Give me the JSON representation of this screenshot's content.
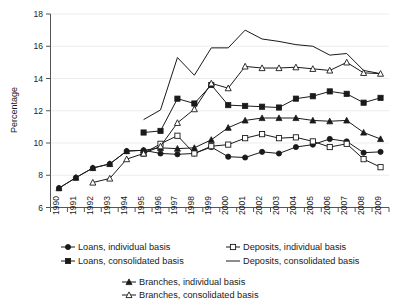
{
  "chart_data": {
    "type": "line",
    "title": "",
    "xlabel": "",
    "ylabel": "Percentage",
    "ylim": [
      6,
      18
    ],
    "yticks": [
      6,
      8,
      10,
      12,
      14,
      16,
      18
    ],
    "grid": true,
    "legend_position": "bottom",
    "categories": [
      "1990",
      "1991",
      "1992",
      "1993",
      "1994",
      "1995",
      "1996",
      "1997",
      "1998",
      "1999",
      "2000",
      "2001",
      "2002",
      "2003",
      "2004",
      "2005",
      "2006",
      "2007",
      "2008",
      "2009"
    ],
    "series": [
      {
        "name": "Loans, individual basis",
        "marker": "filled-circle",
        "values": [
          7.2,
          7.85,
          8.45,
          8.7,
          9.5,
          9.55,
          9.35,
          9.3,
          9.35,
          9.75,
          9.15,
          9.1,
          9.45,
          9.35,
          9.75,
          9.9,
          10.25,
          10.1,
          9.4,
          9.45
        ]
      },
      {
        "name": "Loans, consolidated basis",
        "marker": "filled-square",
        "values": [
          null,
          null,
          null,
          null,
          null,
          10.65,
          10.75,
          12.75,
          12.45,
          13.6,
          12.35,
          12.3,
          12.25,
          12.2,
          12.75,
          12.9,
          13.2,
          13.05,
          12.5,
          12.8
        ]
      },
      {
        "name": "Deposits, individual basis",
        "marker": "open-square",
        "values": [
          null,
          null,
          null,
          null,
          null,
          9.35,
          9.95,
          10.45,
          9.35,
          9.8,
          9.9,
          10.3,
          10.55,
          10.3,
          10.35,
          10.1,
          9.75,
          9.95,
          9.0,
          8.5
        ]
      },
      {
        "name": "Deposits, consolidated basis",
        "marker": "none",
        "values": [
          null,
          null,
          null,
          null,
          null,
          11.45,
          12.05,
          15.3,
          14.2,
          15.9,
          15.9,
          17.0,
          16.45,
          16.3,
          16.1,
          16.0,
          15.45,
          15.55,
          14.5,
          14.3
        ]
      },
      {
        "name": "Branches, individual basis",
        "marker": "filled-triangle",
        "values": [
          7.2,
          7.85,
          8.45,
          8.7,
          9.5,
          9.55,
          9.7,
          9.65,
          9.7,
          10.2,
          10.95,
          11.4,
          11.55,
          11.55,
          11.55,
          11.4,
          11.35,
          11.4,
          10.65,
          10.25
        ]
      },
      {
        "name": "Branches, consolidated basis",
        "marker": "open-triangle",
        "values": [
          null,
          null,
          7.55,
          7.8,
          9.0,
          9.35,
          9.8,
          11.25,
          12.1,
          13.7,
          13.4,
          14.75,
          14.65,
          14.65,
          14.7,
          14.6,
          14.5,
          15.0,
          14.35,
          14.3
        ]
      }
    ]
  },
  "legend": {
    "rows": [
      [
        {
          "label": "Loans, individual basis",
          "marker": "filled-circle"
        },
        {
          "label": "Deposits, individual basis",
          "marker": "open-square"
        }
      ],
      [
        {
          "label": "Loans, consolidated basis",
          "marker": "filled-square"
        },
        {
          "label": "Deposits, consolidated basis",
          "marker": "none"
        }
      ]
    ],
    "rows2": [
      [
        {
          "label": "Branches, individual basis",
          "marker": "filled-triangle"
        }
      ],
      [
        {
          "label": "Branches, consolidated basis",
          "marker": "open-triangle"
        }
      ]
    ]
  },
  "colors": {
    "ink": "#1a1a1a",
    "axis": "#555555",
    "grid": "#e9e9e9",
    "background": "#ffffff"
  }
}
